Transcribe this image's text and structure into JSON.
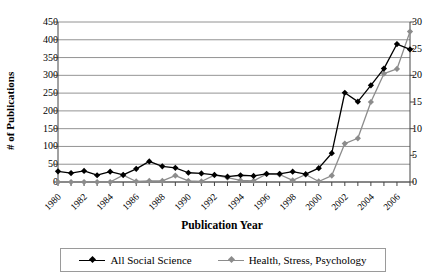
{
  "chart_data": {
    "type": "line",
    "title": "",
    "xlabel": "Publication Year",
    "ylabel": "# of Publications",
    "ylabel_right": "",
    "grid": true,
    "legend_position": "bottom",
    "x": [
      1980,
      1981,
      1982,
      1983,
      1984,
      1985,
      1986,
      1987,
      1988,
      1989,
      1990,
      1991,
      1992,
      1993,
      1994,
      1995,
      1996,
      1997,
      1998,
      1999,
      2000,
      2001,
      2002,
      2003,
      2004,
      2005,
      2006,
      2007
    ],
    "x_tick_labels": [
      "1980",
      "1982",
      "1984",
      "1986",
      "1988",
      "1990",
      "1992",
      "1994",
      "1996",
      "1998",
      "2000",
      "2002",
      "2004",
      "2006"
    ],
    "y_tick_labels_left": [
      "0",
      "50",
      "100",
      "150",
      "200",
      "250",
      "300",
      "350",
      "400",
      "450"
    ],
    "y_tick_labels_right": [
      "0",
      "5",
      "10",
      "15",
      "20",
      "25",
      "30"
    ],
    "ylim_left": [
      0,
      450
    ],
    "ylim_right": [
      0,
      30
    ],
    "series": [
      {
        "name": "All Social Science",
        "axis": "left",
        "color": "#000000",
        "marker": "diamond",
        "values": [
          30,
          25,
          31,
          19,
          29,
          20,
          37,
          58,
          44,
          40,
          26,
          24,
          20,
          15,
          19,
          17,
          23,
          23,
          29,
          22,
          39,
          81,
          251,
          226,
          272,
          319,
          388,
          373
        ]
      },
      {
        "name": "Health, Stress, Psychology",
        "axis": "right",
        "color": "#8c8c8c",
        "marker": "diamond",
        "values": [
          0,
          0,
          0,
          0,
          0,
          1.3,
          0.1,
          0.2,
          0.2,
          1.2,
          0.2,
          0.1,
          1.3,
          0.8,
          0.3,
          0.2,
          1.5,
          1.4,
          0.3,
          1.4,
          0.1,
          1.2,
          7.2,
          8.2,
          15.0,
          20.3,
          21.2,
          28.2
        ]
      }
    ]
  },
  "axis": {
    "y_left_title": "# of Publications",
    "x_title": "Publication Year"
  },
  "legend": {
    "items": [
      {
        "label": "All Social Science",
        "color": "#000000"
      },
      {
        "label": "Health, Stress, Psychology",
        "color": "#8c8c8c"
      }
    ]
  }
}
